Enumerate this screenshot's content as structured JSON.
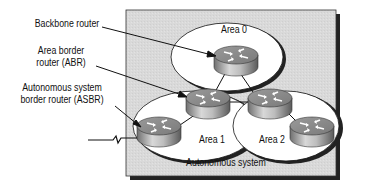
{
  "diagram": {
    "callouts": {
      "backbone_router": "Backbone router",
      "abr_line1": "Area border",
      "abr_line2": "router (ABR)",
      "asbr_line1": "Autonomous system",
      "asbr_line2": "border router (ASBR)"
    },
    "areas": {
      "area0": "Area 0",
      "area1": "Area 1",
      "area2": "Area 2"
    },
    "container_label": "Autonomous system",
    "colors": {
      "background_box": "#d9d9d9",
      "area_fill": "#ffffff",
      "outline": "#111111",
      "shadow": "#222222"
    }
  }
}
